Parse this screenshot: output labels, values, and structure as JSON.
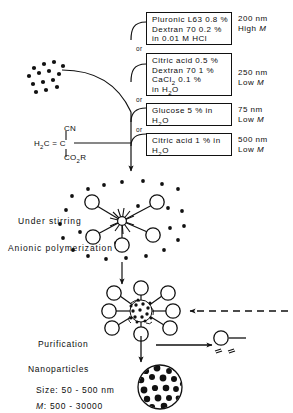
{
  "monomer": {
    "left": "H",
    "left_sub": "2",
    "left_rest": "C",
    "bond": "=",
    "center": "C",
    "top_group": "CN",
    "bottom_group_main": "CO",
    "bottom_group_sub": "2",
    "bottom_group_rest": "R"
  },
  "or_label": "or",
  "recipes": [
    {
      "lines": [
        {
          "text": "Pluronic L63  0.8 %"
        },
        {
          "text": "Dextran 70  0.2 %"
        },
        {
          "text": "in 0.01 M HCl"
        }
      ],
      "size": "200 nm",
      "mw_prefix": "High ",
      "mw_symbol": "M"
    },
    {
      "lines": [
        {
          "text": "Citric acid 0.5 %"
        },
        {
          "text": "Dextran 70  1 %"
        },
        {
          "html": "CaCl<sub>2</sub> 0.1 %"
        },
        {
          "html": "in H<sub>2</sub>O"
        }
      ],
      "size": "250 nm",
      "mw_prefix": "Low ",
      "mw_symbol": "M"
    },
    {
      "lines": [
        {
          "text": "Glucose 5 %  in"
        },
        {
          "html": "H<sub>2</sub>O"
        }
      ],
      "size": "75 nm",
      "mw_prefix": "Low ",
      "mw_symbol": "M"
    },
    {
      "lines": [
        {
          "text": "Citric acid 1 % in"
        },
        {
          "html": "H<sub>2</sub>O"
        }
      ],
      "size": "500 nm",
      "mw_prefix": "Low ",
      "mw_symbol": "M"
    }
  ],
  "stage_labels": {
    "stirring": "Under  stirring",
    "polymerization": "Anionic polymerization",
    "purification": "Purification",
    "product": "Nanoparticles"
  },
  "product_specs": {
    "size_label": "Size:",
    "size_value": "50 - 500 nm",
    "mw_symbol": "M",
    "mw_label": ":",
    "mw_value": "500 - 30000"
  },
  "colors": {
    "ink": "#0d0d0d",
    "paper": "#ffffff",
    "line": "#111111"
  }
}
